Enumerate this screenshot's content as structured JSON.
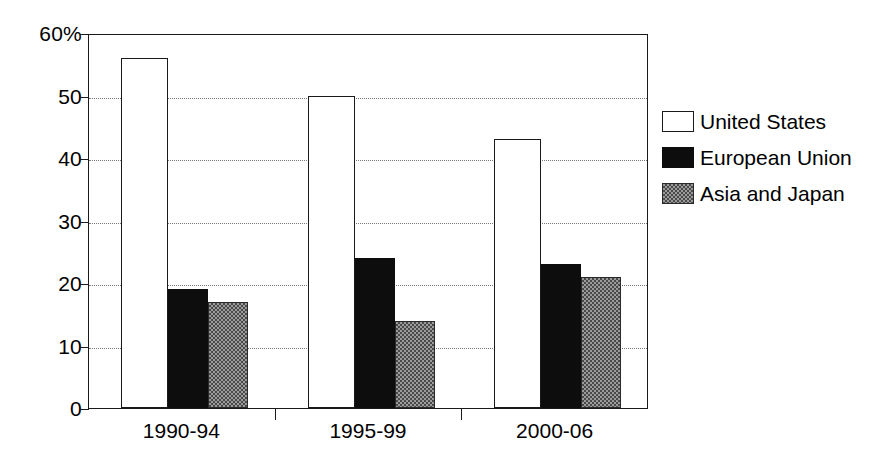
{
  "chart_data": {
    "type": "bar",
    "title": "",
    "subtitle": "",
    "xlabel": "",
    "ylabel": "",
    "categories": [
      "1990-94",
      "1995-99",
      "2000-06"
    ],
    "series": [
      {
        "name": "United States",
        "values": [
          56,
          50,
          43
        ],
        "swatch": "white-outline"
      },
      {
        "name": "European Union",
        "values": [
          19,
          24,
          23
        ],
        "swatch": "solid-black"
      },
      {
        "name": "Asia and Japan",
        "values": [
          17,
          14,
          21
        ],
        "swatch": "stipple-gray"
      }
    ],
    "ylim": [
      0,
      60
    ],
    "y_ticks": [
      0,
      10,
      20,
      30,
      40,
      50,
      60
    ],
    "y_tick_labels": [
      "0",
      "10",
      "20",
      "30",
      "40",
      "50",
      "60%"
    ],
    "y_unit": "%",
    "grid": "horizontal-dotted",
    "legend_position": "right",
    "annotations": []
  },
  "colors": {
    "axis": "#1a1a1a",
    "gridline": "#777777",
    "series_united_states": "#ffffff",
    "series_european_union": "#0d0d0d",
    "series_asia_and_japan": "#9a9a9a",
    "background": "#ffffff",
    "text": "#000000"
  }
}
